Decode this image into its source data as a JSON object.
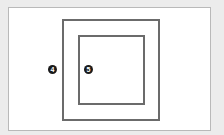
{
  "diagram": {
    "background_color": "#ececec",
    "card_color": "#ffffff",
    "line_color": "#6b6b6b",
    "shapes": [
      {
        "name": "outer-square",
        "type": "rectangle"
      },
      {
        "name": "inner-square",
        "type": "rectangle"
      }
    ],
    "markers": [
      {
        "label": "4",
        "position": "left of outer square"
      },
      {
        "label": "5",
        "position": "inside outer square, left of inner square edge"
      }
    ]
  }
}
